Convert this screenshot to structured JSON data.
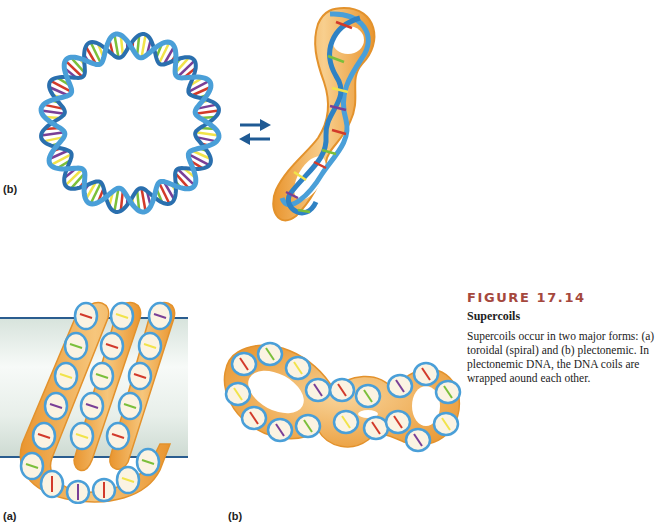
{
  "figure": {
    "number": "FIGURE 17.14",
    "title": "Supercoils",
    "body": "Supercoils occur in two major forms: (a) toroidal (spiral) and (b) plectonemic. In plectonemic DNA, the DNA coils are wrapped aound each other."
  },
  "panels": {
    "top_left_label": "(b)",
    "bottom_left_label": "(a)",
    "bottom_middle_label": "(b)"
  },
  "illustrations": {
    "top_left": "relaxed-circular-dna",
    "top_arrows": "equilibrium-arrows",
    "top_right": "plectonemic-supercoil-vertical",
    "bottom_left": "toroidal-supercoil-on-cylinder",
    "bottom_middle": "plectonemic-supercoil-horizontal"
  },
  "colors": {
    "backbone": "#4a9fd8",
    "backbone_dark": "#2a6fae",
    "tube": "#f2ac4e",
    "tube_light": "#f8d49a",
    "figure_number": "#a5483d",
    "arrow": "#1f5a94",
    "cylinder_line": "#2a5d8f",
    "base_colors": [
      "#d23a2a",
      "#7bbf3a",
      "#f1e34a",
      "#7a3f96"
    ]
  }
}
